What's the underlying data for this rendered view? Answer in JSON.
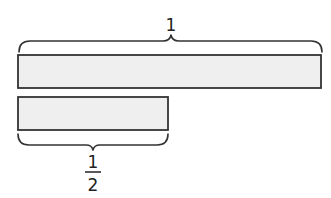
{
  "diagram": {
    "colors": {
      "bar_fill": "#efefef",
      "bar_stroke": "#333333",
      "text": "#222222"
    },
    "whole": {
      "label": "1",
      "bar": {
        "x": 18,
        "y": 55,
        "width": 303,
        "height": 33
      }
    },
    "half": {
      "numerator": "1",
      "denominator": "2",
      "bar": {
        "x": 18,
        "y": 97,
        "width": 150,
        "height": 33
      }
    }
  }
}
